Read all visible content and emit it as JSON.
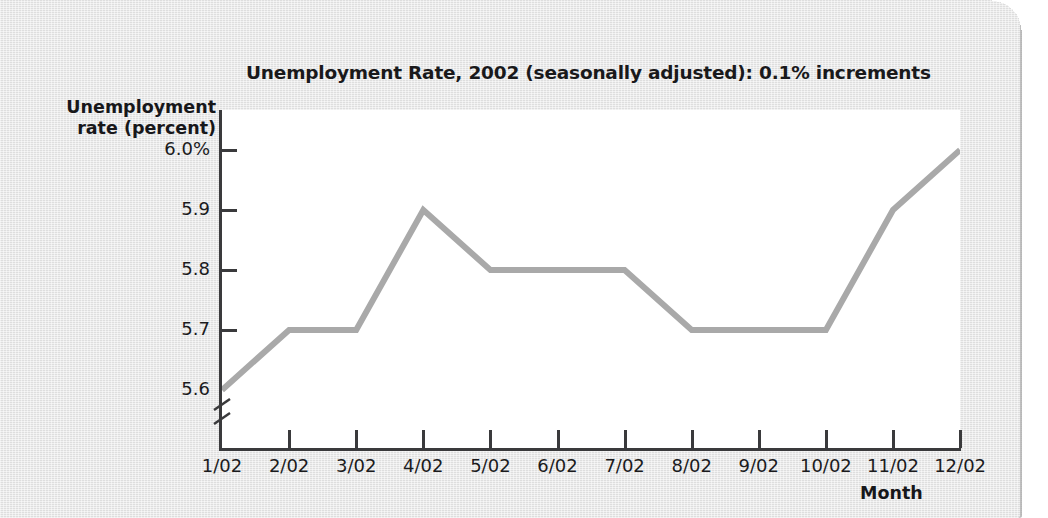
{
  "chart_data": {
    "type": "line",
    "title": "Unemployment Rate, 2002 (seasonally adjusted): 0.1% increments",
    "xlabel": "Month",
    "ylabel": "Unemployment rate (percent)",
    "categories": [
      "1/02",
      "2/02",
      "3/02",
      "4/02",
      "5/02",
      "6/02",
      "7/02",
      "8/02",
      "9/02",
      "10/02",
      "11/02",
      "12/02"
    ],
    "values": [
      5.6,
      5.7,
      5.7,
      5.9,
      5.8,
      5.8,
      5.8,
      5.7,
      5.7,
      5.7,
      5.9,
      6.0
    ],
    "ytick_labels": [
      "6.0%",
      "5.9",
      "5.8",
      "5.7",
      "5.6"
    ],
    "ytick_values": [
      6.0,
      5.9,
      5.8,
      5.7,
      5.6
    ],
    "ylim": [
      5.6,
      6.0
    ],
    "y_axis_break": true,
    "grid": false,
    "legend": false,
    "line_color": "#a9a9a9",
    "axis_color": "#3a3a3c",
    "plot_background": "#ffffff",
    "page_background": "#e2e2e2"
  },
  "axis_titles": {
    "y_line1": "Unemployment",
    "y_line2": "rate (percent)",
    "x": "Month"
  }
}
